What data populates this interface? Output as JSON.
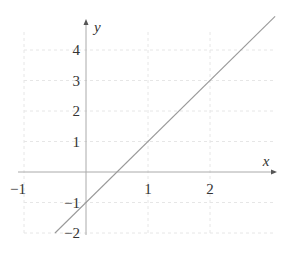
{
  "chart_data": {
    "type": "line",
    "title": "",
    "xlabel": "x",
    "ylabel": "y",
    "xlim": [
      -1,
      3
    ],
    "ylim": [
      -2,
      4.6
    ],
    "grid": true,
    "grid_style": "dashed",
    "x_ticks": [
      -1,
      1,
      2
    ],
    "x_tick_labels": [
      "−1",
      "1",
      "2"
    ],
    "y_ticks": [
      -2,
      -1,
      1,
      2,
      3,
      4
    ],
    "y_tick_labels": [
      "−2",
      "−1",
      "1",
      "2",
      "3",
      "4"
    ],
    "series": [
      {
        "name": "y = 2x − 1",
        "x": [
          -0.5,
          3.05
        ],
        "y": [
          -2,
          5.1
        ],
        "color": "#999999"
      }
    ]
  },
  "colors": {
    "axis": "#aaaaaa",
    "grid": "#e6e6e6",
    "line": "#999999",
    "text": "#333333"
  }
}
